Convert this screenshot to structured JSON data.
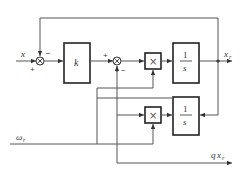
{
  "diagram": {
    "type": "block-diagram",
    "inputs": {
      "x": "x",
      "omega": "ω",
      "omega_sub": "r"
    },
    "outputs": {
      "xr": "x",
      "xr_sub": "r",
      "qxr_q": "q",
      "qxr_x": "x",
      "qxr_sub": "r"
    },
    "blocks": {
      "gain": "k",
      "int_num": "1",
      "int_den": "s",
      "mult": "×"
    },
    "signs": {
      "sum1_in": "+",
      "sum1_fb": "−",
      "sum2_in": "+",
      "sum2_fb": "−"
    }
  }
}
